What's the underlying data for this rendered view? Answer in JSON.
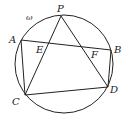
{
  "diagram": {
    "circle_label": "ω",
    "points": {
      "P": {
        "label": "P",
        "x": 61,
        "y": 16
      },
      "A": {
        "label": "A",
        "x": 21,
        "y": 40
      },
      "B": {
        "label": "B",
        "x": 111,
        "y": 50
      },
      "C": {
        "label": "C",
        "x": 25,
        "y": 95
      },
      "D": {
        "label": "D",
        "x": 108,
        "y": 87
      },
      "E": {
        "label": "E",
        "x": 49,
        "y": 43
      },
      "F": {
        "label": "F",
        "x": 82,
        "y": 47
      }
    },
    "segments": [
      "AB",
      "AC",
      "CD",
      "BD",
      "PC",
      "PD"
    ]
  }
}
